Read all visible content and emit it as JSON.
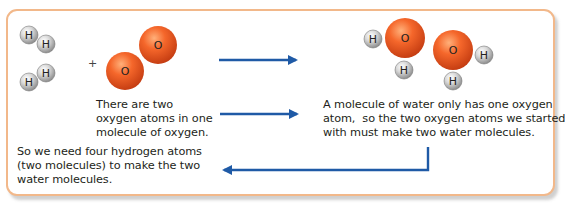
{
  "diagram": {
    "reactants": {
      "hydrogen_molecules": [
        {
          "atoms": [
            "H",
            "H"
          ]
        },
        {
          "atoms": [
            "H",
            "H"
          ]
        }
      ],
      "operator": "+",
      "oxygen_molecule": {
        "atoms": [
          "O",
          "O"
        ]
      }
    },
    "products": {
      "water_molecules": [
        {
          "atoms": [
            "H",
            "O",
            "H"
          ]
        },
        {
          "atoms": [
            "O",
            "H",
            "H"
          ]
        }
      ]
    },
    "texts": {
      "oxygen_note": "There are two\noxygen atoms in one\nmolecule of oxygen.",
      "water_note": "A molecule of water only has one oxygen\natom,  so the two oxygen atoms we started\nwith must make two water molecules.",
      "hydrogen_note": "So we need four hydrogen atoms\n(two molecules) to make the two\nwater molecules."
    },
    "labels": {
      "hydrogen": "H",
      "oxygen": "O"
    },
    "arrows": [
      {
        "id": "reaction-arrow",
        "from": "reactants",
        "to": "products",
        "direction": "right"
      },
      {
        "id": "oxygen-note-arrow",
        "from": "oxygen_note",
        "to": "water_note",
        "direction": "right"
      },
      {
        "id": "return-arrow",
        "from": "water_note",
        "to": "hydrogen_note",
        "direction": "left"
      }
    ],
    "colors": {
      "border": "#f2b88a",
      "arrow": "#1f5aa6",
      "oxygen": "#f05a28",
      "hydrogen": "#c8c8c8",
      "text": "#231f20"
    }
  }
}
